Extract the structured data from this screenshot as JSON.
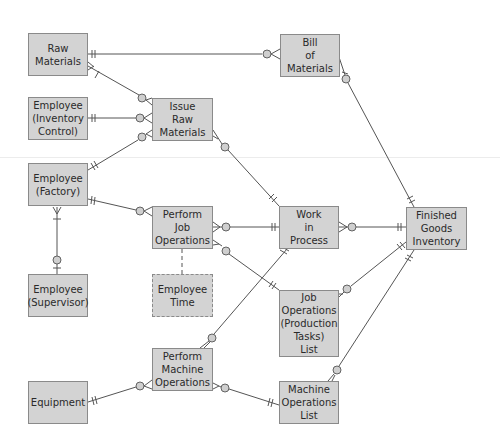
{
  "diagram": {
    "entities": [
      {
        "id": "raw_materials",
        "label": "Raw\nMaterials",
        "x": 28,
        "y": 33,
        "w": 60,
        "h": 43,
        "style": "solid"
      },
      {
        "id": "emp_inventory",
        "label": "Employee\n(Inventory\nControl)",
        "x": 28,
        "y": 97,
        "w": 60,
        "h": 43,
        "style": "solid"
      },
      {
        "id": "emp_factory",
        "label": "Employee\n(Factory)",
        "x": 28,
        "y": 163,
        "w": 60,
        "h": 43,
        "style": "solid"
      },
      {
        "id": "emp_supervisor",
        "label": "Employee\n(Supervisor)",
        "x": 28,
        "y": 274,
        "w": 60,
        "h": 43,
        "style": "solid"
      },
      {
        "id": "equipment",
        "label": "Equipment",
        "x": 28,
        "y": 381,
        "w": 60,
        "h": 43,
        "style": "solid"
      },
      {
        "id": "issue_raw",
        "label": "Issue\nRaw\nMaterials",
        "x": 152,
        "y": 98,
        "w": 61,
        "h": 43,
        "style": "solid"
      },
      {
        "id": "perform_job",
        "label": "Perform\nJob\nOperations",
        "x": 152,
        "y": 206,
        "w": 61,
        "h": 43,
        "style": "solid"
      },
      {
        "id": "employee_time",
        "label": "Employee\nTime",
        "x": 152,
        "y": 274,
        "w": 61,
        "h": 43,
        "style": "dashed"
      },
      {
        "id": "perform_machine",
        "label": "Perform\nMachine\nOperations",
        "x": 152,
        "y": 348,
        "w": 61,
        "h": 43,
        "style": "solid"
      },
      {
        "id": "bill_of_materials",
        "label": "Bill\nof\nMaterials",
        "x": 280,
        "y": 34,
        "w": 60,
        "h": 43,
        "style": "solid"
      },
      {
        "id": "work_in_process",
        "label": "Work\nin\nProcess",
        "x": 279,
        "y": 206,
        "w": 60,
        "h": 43,
        "style": "solid"
      },
      {
        "id": "finished_goods",
        "label": "Finished\nGoods\nInventory",
        "x": 406,
        "y": 207,
        "w": 61,
        "h": 43,
        "style": "solid"
      },
      {
        "id": "job_ops_list",
        "label": "Job\nOperations\n(Production\nTasks)\nList",
        "x": 279,
        "y": 290,
        "w": 60,
        "h": 67,
        "style": "solid"
      },
      {
        "id": "machine_ops_list",
        "label": "Machine\nOperations\nList",
        "x": 279,
        "y": 381,
        "w": 60,
        "h": 43,
        "style": "solid"
      }
    ],
    "relationships": [
      {
        "from": "raw_materials",
        "to": "bill_of_materials",
        "from_card": "one-and-only-one",
        "to_card": "zero-or-many"
      },
      {
        "from": "raw_materials",
        "to": "issue_raw",
        "from_card": "one-or-many",
        "to_card": "zero-or-many"
      },
      {
        "from": "emp_inventory",
        "to": "issue_raw",
        "from_card": "one-and-only-one",
        "to_card": "zero-or-many"
      },
      {
        "from": "emp_factory",
        "to": "issue_raw",
        "from_card": "one-and-only-one",
        "to_card": "zero-or-many"
      },
      {
        "from": "emp_factory",
        "to": "perform_job",
        "from_card": "one-and-only-one",
        "to_card": "zero-or-many"
      },
      {
        "from": "emp_factory",
        "to": "emp_supervisor",
        "from_card": "one-or-many",
        "to_card": "zero-or-one"
      },
      {
        "from": "issue_raw",
        "to": "work_in_process",
        "from_card": "zero-or-many",
        "to_card": "one-and-only-one"
      },
      {
        "from": "bill_of_materials",
        "to": "finished_goods",
        "from_card": "zero-or-many",
        "to_card": "one-and-only-one"
      },
      {
        "from": "perform_job",
        "to": "work_in_process",
        "from_card": "zero-or-many",
        "to_card": "one-and-only-one"
      },
      {
        "from": "perform_job",
        "to": "job_ops_list",
        "from_card": "zero-or-many",
        "to_card": "one-and-only-one"
      },
      {
        "from": "perform_job",
        "to": "employee_time",
        "from_card": "",
        "to_card": "",
        "style": "dashed"
      },
      {
        "from": "work_in_process",
        "to": "finished_goods",
        "from_card": "zero-or-many",
        "to_card": "one-and-only-one"
      },
      {
        "from": "perform_machine",
        "to": "work_in_process",
        "from_card": "zero-or-many",
        "to_card": "one-and-only-one"
      },
      {
        "from": "job_ops_list",
        "to": "finished_goods",
        "from_card": "zero-or-many",
        "to_card": "one-and-only-one"
      },
      {
        "from": "machine_ops_list",
        "to": "finished_goods",
        "from_card": "zero-or-many",
        "to_card": "one-and-only-one"
      },
      {
        "from": "equipment",
        "to": "perform_machine",
        "from_card": "one-and-only-one",
        "to_card": "zero-or-many"
      },
      {
        "from": "perform_machine",
        "to": "machine_ops_list",
        "from_card": "zero-or-many",
        "to_card": "one-and-only-one"
      }
    ],
    "colors": {
      "entity_fill": "#d3d3d3",
      "entity_border": "#8a8a8a",
      "line": "#555555",
      "circle_fill": "#cfcfcf",
      "background": "#ffffff"
    }
  }
}
